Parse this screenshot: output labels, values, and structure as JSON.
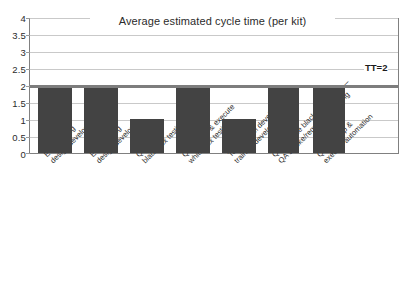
{
  "chart_data": {
    "type": "bar",
    "title": "Average estimated cycle time (per kit)",
    "xlabel": "",
    "ylabel": "",
    "ylim": [
      0,
      4
    ],
    "yticks": [
      "0",
      "0.5",
      "1",
      "1.5",
      "2",
      "2.5",
      "3",
      "3.5",
      "4"
    ],
    "grid": true,
    "legend": false,
    "categories": [
      "Engineering design/develop",
      "Engineering design/develop",
      "QA design black box testing",
      "QA design & execute white box testing",
      "Tech comm development—training development (½)",
      "QA execute black box testing—QA smoke/regression testing",
      "QA develop & execute automation"
    ],
    "category_lines": [
      [
        "Engineering",
        "design/develop"
      ],
      [
        "Engineering",
        "design/develop"
      ],
      [
        "QA design",
        "black box testing"
      ],
      [
        "QA design & execute",
        "white box testing"
      ],
      [
        "Tech comm development—",
        "training development (½)"
      ],
      [
        "QA execute black box testing—",
        "QA smoke/regression testing"
      ],
      [
        "QA develop &",
        "execute automation"
      ]
    ],
    "values": [
      2,
      2,
      1,
      2,
      1,
      2,
      2
    ],
    "annotations": [
      {
        "name": "takt-time-line",
        "label": "TT=2",
        "value": 2
      }
    ],
    "colors": {
      "bar": "#434343",
      "target_line": "#7d7d7d",
      "gridline": "#c9c9c9",
      "axis": "#808080",
      "text": "#2b2b2b",
      "background": "#ffffff"
    }
  }
}
